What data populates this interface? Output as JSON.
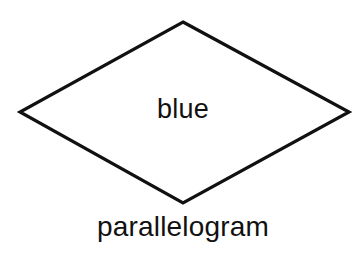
{
  "diagram": {
    "shape": {
      "type": "diamond",
      "label": "blue",
      "stroke_color": "#111111",
      "fill_color": "#ffffff",
      "vertices": {
        "top": [
          183,
          22
        ],
        "right": [
          349,
          112
        ],
        "bottom": [
          183,
          203
        ],
        "left": [
          20,
          112
        ]
      }
    },
    "caption": "parallelogram"
  }
}
